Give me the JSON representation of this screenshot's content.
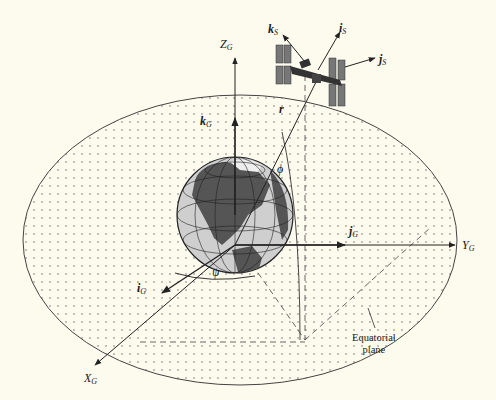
{
  "figure": {
    "type": "geocentric-to-satellite coordinate frame diagram",
    "background": "#fdfbee",
    "ink": "#2a2a2a"
  },
  "axes": {
    "z_axis": {
      "name": "Z",
      "subscript": "G"
    },
    "y_axis": {
      "name": "Y",
      "subscript": "G"
    },
    "x_axis": {
      "name": "X",
      "subscript": "G"
    }
  },
  "unit_vectors": {
    "k_g": {
      "name": "k",
      "subscript": "G"
    },
    "j_g": {
      "name": "j",
      "subscript": "G"
    },
    "i_g": {
      "name": "i",
      "subscript": "G"
    },
    "k_s": {
      "name": "k",
      "subscript": "S"
    },
    "i_s": {
      "name": "i",
      "subscript": "S"
    },
    "j_s": {
      "name": "j",
      "subscript": "S"
    }
  },
  "symbols": {
    "position_vector": "r",
    "latitude_angle": "ϕ",
    "longitude_angle": "ψ"
  },
  "annotations": {
    "equatorial_plane_line1": "Equatorial",
    "equatorial_plane_line2": "plane"
  }
}
